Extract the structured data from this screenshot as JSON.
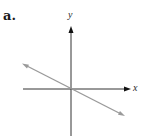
{
  "figure": {
    "part_label": "a.",
    "x_axis_label": "x",
    "y_axis_label": "y"
  },
  "graph": {
    "description": "Line with negative slope passing through the origin, with arrows at both ends",
    "slope_sign": "negative",
    "passes_through_origin": true,
    "colors": {
      "axes": "#222222",
      "line": "#9a9a9a"
    }
  }
}
